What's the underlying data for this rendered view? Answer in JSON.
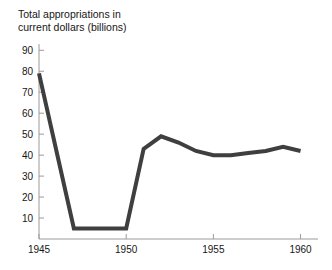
{
  "chart_data": {
    "type": "line",
    "title": "Total appropriations in\ncurrent dollars (billions)",
    "title_line1": "Total appropriations in",
    "title_line2": "current dollars (billions)",
    "xlabel": "",
    "ylabel": "",
    "x": [
      1945,
      1946,
      1947,
      1948,
      1949,
      1950,
      1951,
      1952,
      1953,
      1954,
      1955,
      1956,
      1957,
      1958,
      1959,
      1960
    ],
    "values": [
      79,
      42,
      5,
      5,
      5,
      5,
      43,
      49,
      46,
      42,
      40,
      40,
      41,
      42,
      44,
      42
    ],
    "series": [
      {
        "name": "Total appropriations",
        "values": [
          79,
          42,
          5,
          5,
          5,
          5,
          43,
          49,
          46,
          42,
          40,
          40,
          41,
          42,
          44,
          42
        ]
      }
    ],
    "xlim": [
      1945,
      1961
    ],
    "ylim": [
      0,
      93
    ],
    "xticks": [
      1945,
      1950,
      1955,
      1960
    ],
    "xtick_labels": [
      "1945",
      "1950",
      "1955",
      "1960"
    ],
    "yticks": [
      10,
      20,
      30,
      40,
      50,
      60,
      70,
      80,
      90
    ],
    "ytick_labels": [
      "10",
      "20",
      "30",
      "40",
      "50",
      "60",
      "70",
      "80",
      "90"
    ],
    "grid": false,
    "legend": false,
    "legend_position": "none",
    "line_color": "#3f3f3f",
    "line_width": 4,
    "markers": false,
    "axis_color": "#9a9a9a",
    "background_color": "#ffffff"
  }
}
